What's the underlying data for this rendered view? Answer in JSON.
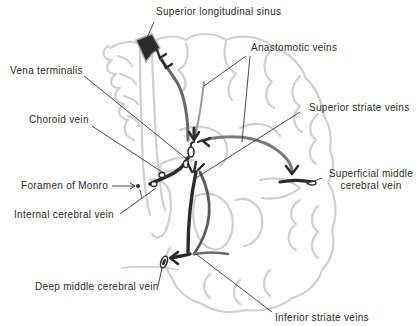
{
  "diagram": {
    "labels": {
      "superior_longitudinal_sinus": "Superior longitudinal sinus",
      "anastomotic_veins": "Anastomotic veins",
      "vena_terminalis": "Vena terminalis",
      "superior_striate_veins": "Superior striate veins",
      "choroid_vein": "Choroid vein",
      "superficial_middle_cerebral_vein_line1": "Superficial middle",
      "superficial_middle_cerebral_vein_line2": "cerebral vein",
      "foramen_of_monro": "Foramen of Monro",
      "internal_cerebral_vein": "Internal cerebral vein",
      "deep_middle_cerebral_vein": "Deep middle cerebral vein",
      "inferior_striate_veins": "Inferior striate veins"
    },
    "colors": {
      "brain_outline": "#cfcfcf",
      "vein_dark": "#2b2b2b",
      "vein_mid": "#8a8a8a",
      "leader_line": "#333333",
      "text": "#2a2a2a"
    }
  }
}
